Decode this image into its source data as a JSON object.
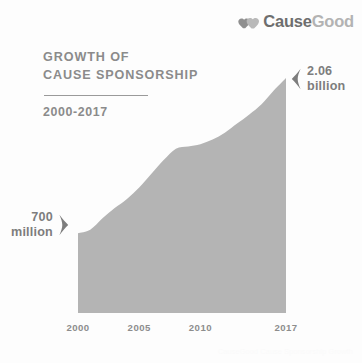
{
  "brand": {
    "mark_icon": "two-hearts-icon",
    "word_primary": "Cause",
    "word_secondary": "Good",
    "color_primary": "#6e6e6e",
    "color_secondary": "#b3b3b3"
  },
  "heading": {
    "line1": "GROWTH OF",
    "line2": "CAUSE SPONSORSHIP",
    "subtitle": "2000-2017"
  },
  "callouts": {
    "start": {
      "value": "700",
      "unit": "million",
      "text": "700\nmillion",
      "chevron_icon": "chevron-right-icon"
    },
    "end": {
      "value": "2.06",
      "unit": "billion",
      "text": "2.06\nbillion",
      "chevron_icon": "chevron-left-icon"
    }
  },
  "watermark": "CauseGood Cause Sponsorship Growth",
  "chart_data": {
    "type": "area",
    "title": "GROWTH OF CAUSE SPONSORSHIP",
    "subtitle": "2000-2017",
    "xlabel": "",
    "ylabel": "",
    "grid": false,
    "legend": null,
    "fill_color": "#b4b4b4",
    "axis_label_color": "#8d8d8d",
    "xlim": [
      2000,
      2017
    ],
    "ylim": [
      0,
      2.2
    ],
    "y_unit": "USD (billions)",
    "tick_labels": [
      "2000",
      "2005",
      "2010",
      "2017"
    ],
    "tick_values": [
      2000,
      2005,
      2010,
      2017
    ],
    "annotations": [
      {
        "at_x": 2000,
        "label": "700 million",
        "value": 0.7
      },
      {
        "at_x": 2017,
        "label": "2.06 billion",
        "value": 2.06
      }
    ],
    "x": [
      2000,
      2001,
      2002,
      2003,
      2004,
      2005,
      2006,
      2007,
      2008,
      2009,
      2010,
      2011,
      2012,
      2013,
      2014,
      2015,
      2016,
      2017
    ],
    "values": [
      0.7,
      0.73,
      0.83,
      0.92,
      1.0,
      1.1,
      1.22,
      1.34,
      1.44,
      1.46,
      1.48,
      1.52,
      1.58,
      1.66,
      1.74,
      1.83,
      1.95,
      2.06
    ],
    "series": [
      {
        "name": "Cause sponsorship spending",
        "unit": "USD billions",
        "values": [
          0.7,
          0.73,
          0.83,
          0.92,
          1.0,
          1.1,
          1.22,
          1.34,
          1.44,
          1.46,
          1.48,
          1.52,
          1.58,
          1.66,
          1.74,
          1.83,
          1.95,
          2.06
        ]
      }
    ]
  }
}
